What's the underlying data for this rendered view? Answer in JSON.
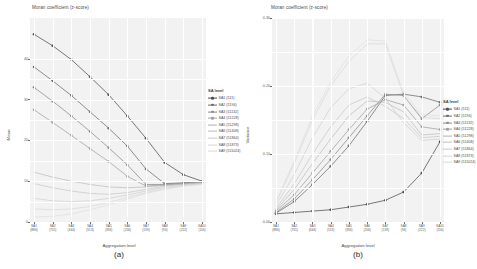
{
  "figure": {
    "panels": [
      {
        "id": "a",
        "caption": "(a)",
        "title": "Moran coefficient (z-score)",
        "ylabel": "Mean",
        "xlabel": "Aggregation level"
      },
      {
        "id": "b",
        "caption": "(b)",
        "title": "Moran coefficient (z-score)",
        "ylabel": "Variance",
        "xlabel": "Aggregation level"
      }
    ],
    "legend": {
      "title": "SA level",
      "entries": [
        "SA1 (511)",
        "SA2 (5194)",
        "SA3 (51132)",
        "SA4 (51228)",
        "SA5 (51298)",
        "SA6 (51408)",
        "SA7 (51864)",
        "SA8 (51873)",
        "SA9 (511024)"
      ]
    }
  },
  "chart_data": [
    {
      "type": "line",
      "panel": "a",
      "title": "Moran coefficient (z-score)",
      "xlabel": "Aggregation level",
      "ylabel": "Mean",
      "grid": true,
      "legend_position": "right",
      "categories": [
        "SA1\n(886)",
        "SA2\n(755)",
        "SA3\n(644)",
        "SA4\n(513)",
        "SA5\n(394)",
        "SA6\n(256)",
        "SA7\n(139)",
        "SA8\n(94)",
        "SA9\n(222)",
        "SA10\n(116)"
      ],
      "x": [
        1,
        2,
        3,
        4,
        5,
        6,
        7,
        8,
        9,
        10
      ],
      "ylim": [
        0,
        50
      ],
      "yticks": [
        0,
        10,
        20,
        30,
        40
      ],
      "ytick_labels": [
        "0",
        "10",
        "20",
        "30",
        "40"
      ],
      "series": [
        {
          "name": "SA1 (511)",
          "color": "#4d4d4d",
          "values": [
            46.0,
            43.2,
            39.8,
            35.6,
            31.2,
            26.0,
            20.5,
            14.6,
            11.6,
            10.0
          ]
        },
        {
          "name": "SA2 (5194)",
          "color": "#6b6b6b",
          "values": [
            38.0,
            34.6,
            31.0,
            27.0,
            23.0,
            18.6,
            13.0,
            9.4,
            9.6,
            9.9
          ]
        },
        {
          "name": "SA3 (51132)",
          "color": "#8a8a8a",
          "values": [
            33.0,
            29.6,
            26.0,
            22.2,
            18.2,
            14.0,
            9.2,
            9.2,
            9.5,
            9.8
          ]
        },
        {
          "name": "SA4 (51228)",
          "color": "#a0a0a0",
          "values": [
            27.5,
            24.4,
            21.2,
            18.0,
            14.8,
            11.2,
            8.8,
            9.1,
            9.4,
            9.7
          ]
        },
        {
          "name": "SA5 (51298)",
          "color": "#b0b0b0",
          "values": [
            12.2,
            11.0,
            10.0,
            9.2,
            8.6,
            8.4,
            8.6,
            9.0,
            9.3,
            9.6
          ]
        },
        {
          "name": "SA6 (51408)",
          "color": "#bdbdbd",
          "values": [
            9.4,
            8.4,
            7.6,
            7.0,
            6.8,
            7.2,
            8.0,
            8.8,
            9.2,
            9.5
          ]
        },
        {
          "name": "SA7 (51864)",
          "color": "#c8c8c8",
          "values": [
            5.8,
            5.2,
            5.0,
            5.2,
            5.8,
            6.6,
            7.6,
            8.5,
            9.0,
            9.4
          ]
        },
        {
          "name": "SA8 (51873)",
          "color": "#d2d2d2",
          "values": [
            3.2,
            3.0,
            3.2,
            3.8,
            4.8,
            6.0,
            7.2,
            8.2,
            8.9,
            9.3
          ]
        },
        {
          "name": "SA9 (511024)",
          "color": "#dadada",
          "values": [
            1.2,
            1.4,
            2.0,
            3.0,
            4.2,
            5.6,
            7.0,
            8.0,
            8.8,
            9.2
          ]
        }
      ]
    },
    {
      "type": "line",
      "panel": "b",
      "title": "Moran coefficient (z-score)",
      "xlabel": "Aggregation level",
      "ylabel": "Variance",
      "grid": true,
      "legend_position": "right",
      "categories": [
        "SA1\n(886)",
        "SA2\n(755)",
        "SA3\n(644)",
        "SA4\n(513)",
        "SA5\n(394)",
        "SA6\n(256)",
        "SA7\n(139)",
        "SA8\n(94)",
        "SA9\n(222)",
        "SA10\n(116)"
      ],
      "x": [
        1,
        2,
        3,
        4,
        5,
        6,
        7,
        8,
        9,
        10
      ],
      "ylim": [
        0,
        0.3
      ],
      "yticks": [
        0.0,
        0.1,
        0.2,
        0.3
      ],
      "ytick_labels": [
        "0.00",
        "0.10",
        "0.20",
        "0.30"
      ],
      "series": [
        {
          "name": "SA1 (511)",
          "color": "#4d4d4d",
          "values": [
            0.012,
            0.014,
            0.016,
            0.018,
            0.022,
            0.026,
            0.032,
            0.044,
            0.072,
            0.118
          ]
        },
        {
          "name": "SA2 (5194)",
          "color": "#6b6b6b",
          "values": [
            0.013,
            0.03,
            0.055,
            0.082,
            0.112,
            0.148,
            0.186,
            0.188,
            0.184,
            0.176
          ]
        },
        {
          "name": "SA3 (51132)",
          "color": "#8a8a8a",
          "values": [
            0.014,
            0.034,
            0.062,
            0.092,
            0.124,
            0.156,
            0.188,
            0.186,
            0.152,
            0.172
          ]
        },
        {
          "name": "SA4 (51228)",
          "color": "#a0a0a0",
          "values": [
            0.016,
            0.04,
            0.072,
            0.104,
            0.136,
            0.166,
            0.18,
            0.172,
            0.14,
            0.136
          ]
        },
        {
          "name": "SA5 (51298)",
          "color": "#b0b0b0",
          "values": [
            0.018,
            0.048,
            0.086,
            0.122,
            0.156,
            0.178,
            0.176,
            0.162,
            0.128,
            0.13
          ]
        },
        {
          "name": "SA6 (51408)",
          "color": "#bdbdbd",
          "values": [
            0.02,
            0.056,
            0.1,
            0.14,
            0.172,
            0.184,
            0.17,
            0.152,
            0.124,
            0.126
          ]
        },
        {
          "name": "SA7 (51864)",
          "color": "#c8c8c8",
          "values": [
            0.024,
            0.07,
            0.124,
            0.168,
            0.196,
            0.204,
            0.182,
            0.146,
            0.12,
            0.122
          ]
        },
        {
          "name": "SA8 (51873)",
          "color": "#d2d2d2",
          "values": [
            0.028,
            0.086,
            0.15,
            0.2,
            0.236,
            0.262,
            0.262,
            0.186,
            0.154,
            0.152
          ]
        },
        {
          "name": "SA9 (511024)",
          "color": "#dadada",
          "values": [
            0.03,
            0.09,
            0.156,
            0.206,
            0.244,
            0.268,
            0.266,
            0.19,
            0.158,
            0.156
          ]
        }
      ]
    }
  ]
}
